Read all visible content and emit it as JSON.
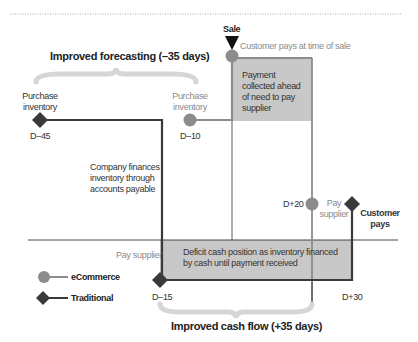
{
  "diagram": {
    "title_top": "Improved forecasting (–35 days)",
    "title_bottom": "Improved cash flow (+35 days)",
    "sale_label": "Sale",
    "customer_pays_at_sale": "Customer pays at time of sale",
    "payment_collected_note": "Payment collected ahead of need to pay supplier",
    "company_finances_note": "Company finances inventory through accounts payable",
    "deficit_note": "Deficit cash position as inventory financed by cash until payment received",
    "traditional": {
      "purchase_label": "Purchase inventory",
      "purchase_day": "D–45",
      "pay_supplier_label": "Pay supplier",
      "pay_supplier_day": "D–15",
      "customer_pays_label": "Customer pays",
      "customer_pays_day": "D+30"
    },
    "ecommerce": {
      "purchase_label": "Purchase inventory",
      "purchase_day": "D–10",
      "pay_supplier_label": "Pay supplier",
      "pay_supplier_day": "D+20"
    },
    "legend": [
      {
        "label": "eCommerce",
        "marker": "circle",
        "color": "#8c8c8c"
      },
      {
        "label": "Traditional",
        "marker": "diamond",
        "color": "#3a3a3a"
      }
    ],
    "colors": {
      "ecommerce": "#8c8c8c",
      "traditional": "#3a3a3a",
      "shade": "#c8c8c8",
      "brace": "#d6d6d6"
    }
  }
}
